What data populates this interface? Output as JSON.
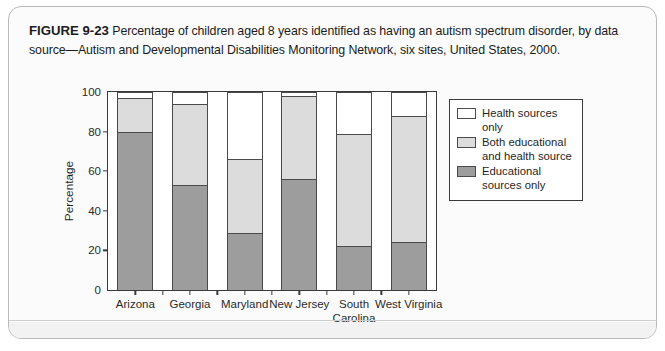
{
  "figure": {
    "number": "FIGURE 9-23",
    "caption": "Percentage of children aged 8 years identified as having an autism spectrum disorder, by data source—Autism and Developmental Disabilities Monitoring Network, six sites, United States, 2000."
  },
  "chart_data": {
    "type": "bar",
    "stacked": true,
    "title": "",
    "xlabel": "State",
    "ylabel": "Percentage",
    "ylim": [
      0,
      100
    ],
    "yticks": [
      0,
      20,
      40,
      60,
      80,
      100
    ],
    "grid": false,
    "legend_position": "top-right",
    "categories": [
      "Arizona",
      "Georgia",
      "Maryland",
      "New Jersey",
      "South Carolina",
      "West Virginia"
    ],
    "series": [
      {
        "name": "Educational sources only",
        "color": "#9d9d9d",
        "values": [
          80,
          53,
          29,
          56,
          22,
          24
        ]
      },
      {
        "name": "Both educational and health source",
        "color": "#dcdcdc",
        "values": [
          17,
          41,
          37,
          42,
          57,
          64
        ]
      },
      {
        "name": "Health sources only",
        "color": "#ffffff",
        "values": [
          3,
          6,
          34,
          2,
          21,
          12
        ]
      }
    ],
    "cumulative_tops": {
      "educational_only": [
        80,
        53,
        29,
        56,
        22,
        24
      ],
      "educational_plus_both": [
        97,
        94,
        66,
        98,
        79,
        88
      ],
      "total": [
        100,
        100,
        100,
        100,
        100,
        100
      ]
    }
  },
  "legend": {
    "items": [
      {
        "label": "Health sources only",
        "swatch": "health"
      },
      {
        "label": "Both educational and health source",
        "swatch": "both"
      },
      {
        "label": "Educational sources only",
        "swatch": "edu"
      }
    ]
  }
}
